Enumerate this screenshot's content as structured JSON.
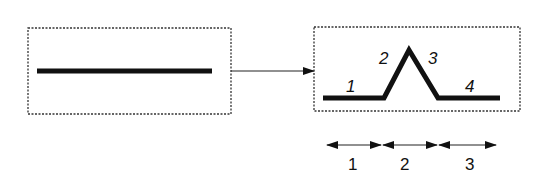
{
  "diagram": {
    "left_box": {
      "name": "initial-state",
      "content": "flat-line"
    },
    "transition_arrow": {
      "direction": "left-to-right"
    },
    "right_box": {
      "name": "deformed-state",
      "segment_labels": [
        "1",
        "2",
        "3",
        "4"
      ]
    },
    "bottom_ranges": {
      "labels": [
        "1",
        "2",
        "3"
      ]
    },
    "colors": {
      "stroke": "#111111",
      "box_border": "#333333",
      "background": "#ffffff"
    }
  }
}
